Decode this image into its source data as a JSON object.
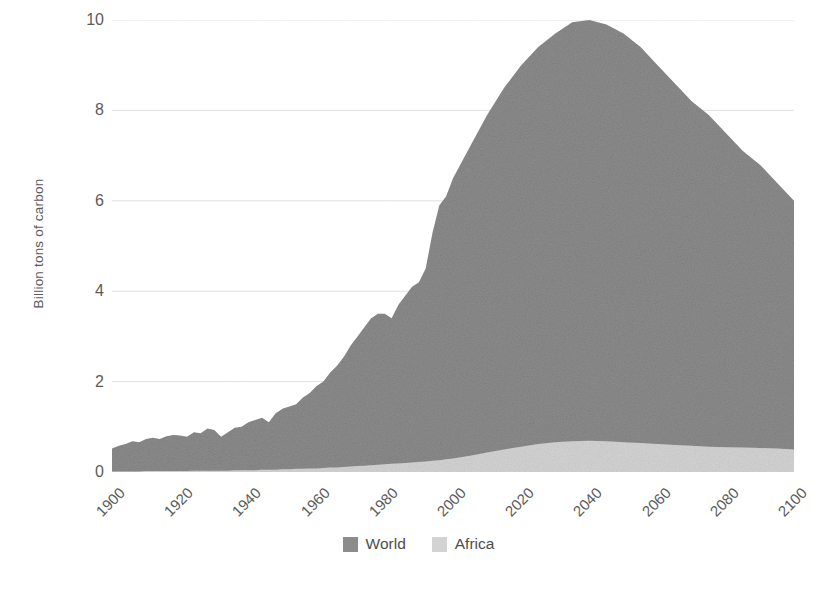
{
  "chart_data": {
    "type": "area",
    "title": "",
    "subtitle": "",
    "xlabel": "",
    "ylabel": "Billion tons of carbon",
    "stacked": false,
    "overlay": true,
    "grid": true,
    "grid_axis": "y",
    "legend_position": "bottom-center",
    "xlim": [
      1900,
      2100
    ],
    "ylim": [
      0,
      10
    ],
    "xticks": [
      1900,
      1920,
      1940,
      1960,
      1980,
      2000,
      2020,
      2040,
      2060,
      2080,
      2100
    ],
    "xtick_labels": [
      "1900",
      "1920",
      "1940",
      "1960",
      "1980",
      "2000",
      "2020",
      "2040",
      "2060",
      "2080",
      "2100"
    ],
    "xtick_rotation": -45,
    "yticks": [
      0,
      2,
      4,
      6,
      8,
      10
    ],
    "ytick_labels": [
      "0",
      "2",
      "4",
      "6",
      "8",
      "10"
    ],
    "colors": {
      "world": "#8c8c8c",
      "africa": "#d3d3d3",
      "grid": "#d8d8d8",
      "text": "#5b5b5b",
      "background": "#ffffff"
    },
    "x": [
      1900,
      1902,
      1904,
      1906,
      1908,
      1910,
      1912,
      1914,
      1916,
      1918,
      1920,
      1922,
      1924,
      1926,
      1928,
      1930,
      1932,
      1934,
      1936,
      1938,
      1940,
      1942,
      1944,
      1946,
      1948,
      1950,
      1952,
      1954,
      1956,
      1958,
      1960,
      1962,
      1964,
      1966,
      1968,
      1970,
      1972,
      1974,
      1976,
      1978,
      1980,
      1982,
      1984,
      1986,
      1988,
      1990,
      1992,
      1994,
      1996,
      1998,
      2000,
      2005,
      2010,
      2015,
      2020,
      2025,
      2030,
      2035,
      2040,
      2045,
      2050,
      2055,
      2060,
      2065,
      2070,
      2075,
      2080,
      2085,
      2090,
      2095,
      2100
    ],
    "series": [
      {
        "name": "World",
        "color": "#8c8c8c",
        "values": [
          0.52,
          0.58,
          0.62,
          0.68,
          0.66,
          0.73,
          0.76,
          0.73,
          0.79,
          0.82,
          0.81,
          0.78,
          0.88,
          0.86,
          0.96,
          0.93,
          0.78,
          0.88,
          0.98,
          1.0,
          1.1,
          1.15,
          1.2,
          1.1,
          1.3,
          1.4,
          1.45,
          1.5,
          1.65,
          1.75,
          1.9,
          2.0,
          2.2,
          2.35,
          2.55,
          2.8,
          3.0,
          3.2,
          3.4,
          3.5,
          3.5,
          3.4,
          3.7,
          3.9,
          4.1,
          4.2,
          4.5,
          5.3,
          5.9,
          6.1,
          6.5,
          7.2,
          7.9,
          8.5,
          9.0,
          9.4,
          9.7,
          9.95,
          10.0,
          9.9,
          9.7,
          9.4,
          9.0,
          8.6,
          8.2,
          7.9,
          7.5,
          7.1,
          6.8,
          6.4,
          6.0
        ]
      },
      {
        "name": "Africa",
        "color": "#d3d3d3",
        "values": [
          0.01,
          0.01,
          0.01,
          0.01,
          0.01,
          0.02,
          0.02,
          0.02,
          0.02,
          0.02,
          0.02,
          0.02,
          0.03,
          0.03,
          0.03,
          0.03,
          0.03,
          0.03,
          0.04,
          0.04,
          0.04,
          0.04,
          0.05,
          0.05,
          0.05,
          0.06,
          0.06,
          0.07,
          0.07,
          0.08,
          0.08,
          0.09,
          0.1,
          0.1,
          0.11,
          0.12,
          0.13,
          0.14,
          0.15,
          0.16,
          0.17,
          0.18,
          0.19,
          0.2,
          0.21,
          0.22,
          0.23,
          0.25,
          0.26,
          0.28,
          0.3,
          0.36,
          0.43,
          0.5,
          0.56,
          0.62,
          0.66,
          0.68,
          0.69,
          0.68,
          0.66,
          0.64,
          0.62,
          0.6,
          0.58,
          0.56,
          0.55,
          0.54,
          0.53,
          0.52,
          0.5
        ]
      }
    ],
    "annotations": []
  },
  "legend": {
    "items": [
      {
        "label": "World",
        "color": "#8c8c8c"
      },
      {
        "label": "Africa",
        "color": "#d3d3d3"
      }
    ]
  }
}
